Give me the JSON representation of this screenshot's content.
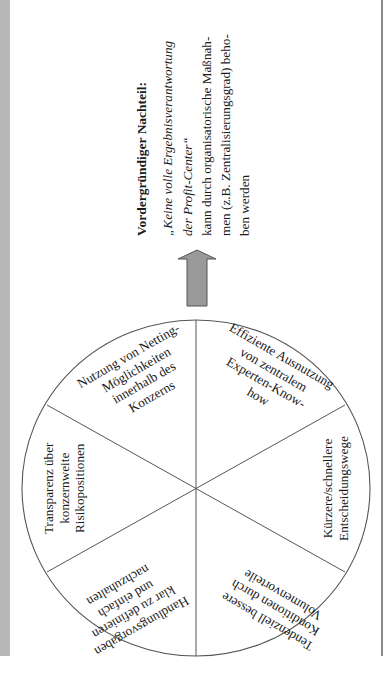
{
  "note": {
    "title": "Vordergründiger Nachteil:",
    "quote_lines": [
      "„Keine volle Ergebnisverantwortung",
      "der Profit-Center“"
    ],
    "body_lines": [
      "kann durch organisatorische Maßnah-",
      "men (z.B. Zentralisierungsgrad) beho-",
      "ben werden"
    ]
  },
  "arrow": {
    "direction": "up",
    "fill": "#9a9a9a",
    "stroke": "#555555"
  },
  "wheel": {
    "segments": [
      {
        "id": "top-left",
        "lines": [
          "Nutzung von Netting-",
          "Möglichkeiten",
          "innerhalb des",
          "Konzerns"
        ]
      },
      {
        "id": "top-right",
        "lines": [
          "Effiziente Ausnutzung",
          "von zentralem",
          "Experten-Know-",
          "how"
        ]
      },
      {
        "id": "right",
        "lines": [
          "Kürzere/schnellere",
          "Entscheidungswege"
        ]
      },
      {
        "id": "bottom-right",
        "lines": [
          "Tendenziell bessere",
          "Konditionen durch",
          "Volumenvorteile"
        ]
      },
      {
        "id": "bottom-left",
        "lines": [
          "Handlungsvorgaben",
          "klar zu definieren",
          "und einfach",
          "nachzuhalten"
        ]
      },
      {
        "id": "left",
        "lines": [
          "Transparenz über",
          "konzernweite",
          "Risikopositionen"
        ]
      }
    ]
  },
  "colors": {
    "band": "#b8b8b8",
    "line": "#555555"
  }
}
